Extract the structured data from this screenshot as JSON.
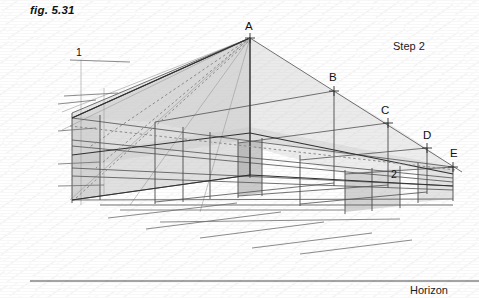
{
  "figure": {
    "caption": "fig. 5.31",
    "step": "Step 2",
    "horizon": "Horizon",
    "background_color": "#ffffff",
    "line_color": "#5a5a5a",
    "dark_line_color": "#2f2f2f",
    "shade_color": "#c9c9c9",
    "texture_color": "#ededed"
  },
  "point_labels": [
    {
      "name": "A",
      "text": "A",
      "x": 245,
      "y": 20,
      "marker_x": 250,
      "marker_y": 38
    },
    {
      "name": "B",
      "text": "B",
      "x": 329,
      "y": 71,
      "marker_x": 334,
      "marker_y": 91
    },
    {
      "name": "C",
      "text": "C",
      "x": 381,
      "y": 104,
      "marker_x": 388,
      "marker_y": 123
    },
    {
      "name": "D",
      "text": "D",
      "x": 423,
      "y": 129,
      "marker_x": 427,
      "marker_y": 148
    },
    {
      "name": "E",
      "text": "E",
      "x": 450,
      "y": 147,
      "marker_x": 453,
      "marker_y": 167
    }
  ],
  "number_labels": [
    {
      "name": "one",
      "text": "1",
      "x": 76,
      "y": 46
    },
    {
      "name": "two",
      "text": "2",
      "x": 391,
      "y": 168
    }
  ],
  "horizon_line": {
    "x1": 30,
    "y1": 281,
    "x2": 479,
    "y2": 281
  },
  "geometry_notes": {
    "type": "two-point-perspective construction",
    "apex": [
      250,
      38
    ],
    "diagonal_from_apex_to": [
      462,
      172
    ],
    "vanishing_direction": "right-descending",
    "box_count": 5
  }
}
